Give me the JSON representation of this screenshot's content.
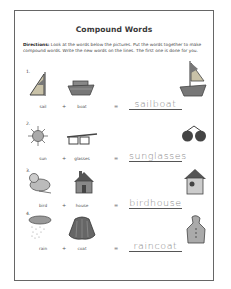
{
  "worksheet": {
    "title": "Compound Words",
    "directions_label": "Directions:",
    "directions_text": "Look at the words below the pictures. Put the words together to make compound words. Write the new words on the lines. The first one is done for you.",
    "plus": "+",
    "equals": "=",
    "items": [
      {
        "number": "1.",
        "word1": "sail",
        "word2": "boat",
        "answer": "sailboat",
        "icon1": "sail-icon",
        "icon2": "boat-icon",
        "icon3": "sailboat-icon"
      },
      {
        "number": "2.",
        "word1": "sun",
        "word2": "glasses",
        "answer": "sunglasses",
        "icon1": "sun-icon",
        "icon2": "glasses-icon",
        "icon3": "sunglasses-icon"
      },
      {
        "number": "3.",
        "word1": "bird",
        "word2": "house",
        "answer": "birdhouse",
        "icon1": "bird-icon",
        "icon2": "house-icon",
        "icon3": "birdhouse-icon"
      },
      {
        "number": "4.",
        "word1": "rain",
        "word2": "coat",
        "answer": "raincoat",
        "icon1": "rain-cloud-icon",
        "icon2": "coat-icon",
        "icon3": "raincoat-icon"
      }
    ]
  }
}
